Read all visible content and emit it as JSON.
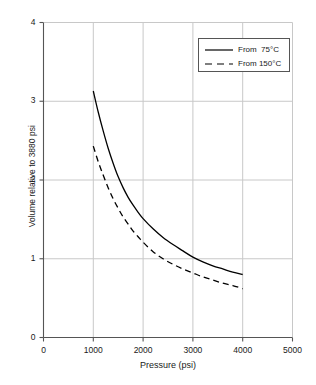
{
  "chart_data": {
    "type": "line",
    "title": "",
    "xlabel": "Pressure (psi)",
    "ylabel": "Volume relative to 3880 psi",
    "xlim": [
      0,
      5000
    ],
    "ylim": [
      0,
      4
    ],
    "xticks": [
      "0",
      "1000",
      "2000",
      "3000",
      "4000",
      "5000"
    ],
    "xtick_values": [
      0,
      1000,
      2000,
      3000,
      4000,
      5000
    ],
    "yticks": [
      "0",
      "1",
      "2",
      "3",
      "4"
    ],
    "ytick_values": [
      0,
      1,
      2,
      3,
      4
    ],
    "grid": "both, light gray, at interior ticks only",
    "legend_position": "upper right (inside plot area)",
    "series": [
      {
        "name": "From  75°C",
        "style": "solid",
        "color": "#000000",
        "x": [
          1000,
          1100,
          1200,
          1300,
          1400,
          1500,
          1600,
          1700,
          1800,
          1900,
          2000,
          2200,
          2400,
          2600,
          2800,
          3000,
          3200,
          3400,
          3600,
          3800,
          4000
        ],
        "y": [
          3.13,
          2.86,
          2.62,
          2.4,
          2.21,
          2.04,
          1.9,
          1.78,
          1.68,
          1.59,
          1.51,
          1.38,
          1.27,
          1.18,
          1.1,
          1.02,
          0.96,
          0.91,
          0.87,
          0.83,
          0.8
        ]
      },
      {
        "name": "From 150°C",
        "style": "dashed",
        "color": "#000000",
        "x": [
          1000,
          1100,
          1200,
          1300,
          1400,
          1500,
          1600,
          1700,
          1800,
          1900,
          2000,
          2200,
          2400,
          2600,
          2800,
          3000,
          3200,
          3400,
          3600,
          3800,
          4000
        ],
        "y": [
          2.43,
          2.23,
          2.06,
          1.9,
          1.76,
          1.64,
          1.53,
          1.44,
          1.35,
          1.28,
          1.21,
          1.09,
          1.0,
          0.93,
          0.87,
          0.82,
          0.77,
          0.73,
          0.69,
          0.66,
          0.62
        ]
      }
    ]
  },
  "legend": {
    "entries": [
      {
        "label": "From  75°C",
        "style": "solid"
      },
      {
        "label": "From 150°C",
        "style": "dashed"
      }
    ]
  },
  "colors": {
    "axis": "#555555",
    "grid": "#c8c8c8",
    "curve": "#000000",
    "background": "#ffffff"
  }
}
